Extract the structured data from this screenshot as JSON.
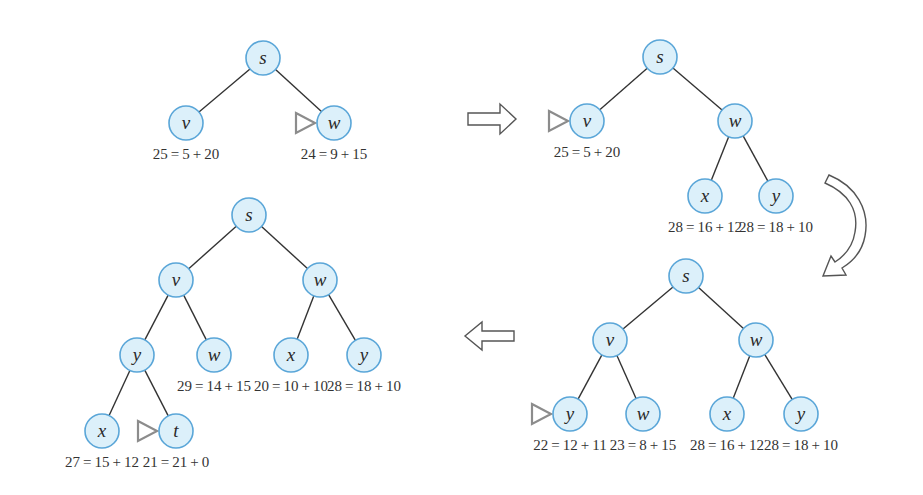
{
  "colors": {
    "node_fill": "#dcf0fa",
    "node_stroke": "#5aa6d8",
    "edge": "#333333",
    "marker": "#8c8c8c"
  },
  "trees": [
    {
      "id": "tree1",
      "nodes": [
        {
          "id": "s",
          "label": "s",
          "x": 263,
          "y": 58
        },
        {
          "id": "v",
          "label": "v",
          "x": 186,
          "y": 123,
          "value": "25=5+20"
        },
        {
          "id": "w",
          "label": "w",
          "x": 334,
          "y": 123,
          "value": "24=9+15",
          "marked": true
        }
      ],
      "edges": [
        [
          "s",
          "v"
        ],
        [
          "s",
          "w"
        ]
      ]
    },
    {
      "id": "tree2",
      "nodes": [
        {
          "id": "s",
          "label": "s",
          "x": 660,
          "y": 57
        },
        {
          "id": "v",
          "label": "v",
          "x": 587,
          "y": 121,
          "value": "25=5+20",
          "marked": true
        },
        {
          "id": "w",
          "label": "w",
          "x": 735,
          "y": 121
        },
        {
          "id": "x",
          "label": "x",
          "x": 705,
          "y": 196,
          "value": "28=16+12"
        },
        {
          "id": "y",
          "label": "y",
          "x": 776,
          "y": 196,
          "value": "28=18+10"
        }
      ],
      "edges": [
        [
          "s",
          "v"
        ],
        [
          "s",
          "w"
        ],
        [
          "w",
          "x"
        ],
        [
          "w",
          "y"
        ]
      ]
    },
    {
      "id": "tree3",
      "nodes": [
        {
          "id": "s",
          "label": "s",
          "x": 686,
          "y": 276
        },
        {
          "id": "v",
          "label": "v",
          "x": 610,
          "y": 340
        },
        {
          "id": "w",
          "label": "w",
          "x": 756,
          "y": 340
        },
        {
          "id": "vy",
          "label": "y",
          "x": 570,
          "y": 414,
          "value": "22=12+11",
          "marked": true
        },
        {
          "id": "vw",
          "label": "w",
          "x": 643,
          "y": 414,
          "value": "23=8+15"
        },
        {
          "id": "wx",
          "label": "x",
          "x": 727,
          "y": 414,
          "value": "28=16+12"
        },
        {
          "id": "wy",
          "label": "y",
          "x": 801,
          "y": 414,
          "value": "28=18+10"
        }
      ],
      "edges": [
        [
          "s",
          "v"
        ],
        [
          "s",
          "w"
        ],
        [
          "v",
          "vy"
        ],
        [
          "v",
          "vw"
        ],
        [
          "w",
          "wx"
        ],
        [
          "w",
          "wy"
        ]
      ]
    },
    {
      "id": "tree4",
      "nodes": [
        {
          "id": "s",
          "label": "s",
          "x": 249,
          "y": 215
        },
        {
          "id": "v",
          "label": "v",
          "x": 176,
          "y": 280
        },
        {
          "id": "w",
          "label": "w",
          "x": 320,
          "y": 280
        },
        {
          "id": "vy",
          "label": "y",
          "x": 137,
          "y": 355
        },
        {
          "id": "vw",
          "label": "w",
          "x": 214,
          "y": 355,
          "value": "29=14+15"
        },
        {
          "id": "wx",
          "label": "x",
          "x": 291,
          "y": 355,
          "value": "20=10+10"
        },
        {
          "id": "wy",
          "label": "y",
          "x": 364,
          "y": 355,
          "value": "28=18+10"
        },
        {
          "id": "yx",
          "label": "x",
          "x": 102,
          "y": 431,
          "value": "27=15+12"
        },
        {
          "id": "yt",
          "label": "t",
          "x": 176,
          "y": 431,
          "value": "21=21+0",
          "marked": true
        }
      ],
      "edges": [
        [
          "s",
          "v"
        ],
        [
          "s",
          "w"
        ],
        [
          "v",
          "vy"
        ],
        [
          "v",
          "vw"
        ],
        [
          "w",
          "wx"
        ],
        [
          "w",
          "wy"
        ],
        [
          "vy",
          "yx"
        ],
        [
          "vy",
          "yt"
        ]
      ]
    }
  ],
  "arrows": [
    {
      "id": "arrow-right",
      "direction": "right"
    },
    {
      "id": "arrow-curved-down",
      "direction": "down"
    },
    {
      "id": "arrow-left",
      "direction": "left"
    }
  ]
}
